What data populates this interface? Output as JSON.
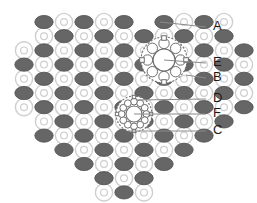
{
  "figure": {
    "background": "#ffffff",
    "width": 257,
    "height": 203
  },
  "colors": {
    "dark_particle": "#666666",
    "dark_particle_stroke": "#4d4d4d",
    "light_ring_stroke": "#cfcfcf",
    "light_ring_fill": "#ffffff",
    "leader_line": "#8a8a8a",
    "label_text": "#1a1a1a",
    "rosette_stroke": "#6e6e6e",
    "rosette_fill": "#ffffff"
  },
  "lattice": {
    "description": "Alternating dark ellipse particles and light open rings arranged on a rectangular grid forming a heart outline",
    "origin_x": 24,
    "origin_y": 22,
    "pitch_x": 20,
    "pitch_y": 14.2,
    "dark_rx": 9.2,
    "dark_ry": 6.6,
    "ring_r": 8.6,
    "ring_inner_r": 3.4,
    "rows": [
      {
        "y_index": 0,
        "cols": [
          1,
          2,
          3,
          4,
          5,
          7,
          8,
          9,
          10
        ],
        "start_type": "ring"
      },
      {
        "y_index": 1,
        "cols": [
          1,
          2,
          3,
          4,
          5,
          6,
          7,
          8,
          9,
          10
        ],
        "start_type": "dark"
      },
      {
        "y_index": 2,
        "cols": [
          0,
          1,
          2,
          3,
          4,
          5,
          6,
          7,
          8,
          9,
          10,
          11
        ],
        "start_type": "ring"
      },
      {
        "y_index": 3,
        "cols": [
          0,
          1,
          2,
          3,
          4,
          5,
          6,
          7,
          8,
          9,
          10,
          11
        ],
        "start_type": "dark"
      },
      {
        "y_index": 4,
        "cols": [
          0,
          1,
          2,
          3,
          4,
          5,
          6,
          7,
          8,
          9,
          10,
          11
        ],
        "start_type": "ring"
      },
      {
        "y_index": 5,
        "cols": [
          0,
          1,
          2,
          3,
          4,
          5,
          6,
          7,
          8,
          9,
          10,
          11
        ],
        "start_type": "dark"
      },
      {
        "y_index": 6,
        "cols": [
          0,
          1,
          2,
          3,
          4,
          5,
          6,
          7,
          8,
          9,
          10,
          11
        ],
        "start_type": "ring"
      },
      {
        "y_index": 7,
        "cols": [
          1,
          2,
          3,
          4,
          5,
          6,
          7,
          8,
          9,
          10
        ],
        "start_type": "dark"
      },
      {
        "y_index": 8,
        "cols": [
          1,
          2,
          3,
          4,
          5,
          6,
          7,
          8,
          9
        ],
        "start_type": "ring"
      },
      {
        "y_index": 9,
        "cols": [
          2,
          3,
          4,
          5,
          6,
          7,
          8
        ],
        "start_type": "dark"
      },
      {
        "y_index": 10,
        "cols": [
          3,
          4,
          5,
          6,
          7
        ],
        "start_type": "ring"
      },
      {
        "y_index": 11,
        "cols": [
          4,
          5,
          6
        ],
        "start_type": "dark"
      },
      {
        "y_index": 12,
        "cols": [
          4,
          5,
          6
        ],
        "start_type": "ring"
      }
    ]
  },
  "rosettes": [
    {
      "id": "upper-rosette",
      "name": "eight-fold-rosette",
      "cx": 164,
      "cy": 60,
      "outer_r": 23,
      "core_r": 11,
      "petals": 8,
      "petal_r": 5.2,
      "petal_orbit": 16.5,
      "nodes": 4,
      "node_size": 4.6,
      "node_orbit": 22
    },
    {
      "id": "lower-rosette",
      "name": "twelve-fold-rosette",
      "cx": 134,
      "cy": 114,
      "outer_r": 18,
      "core_r": 8,
      "petals": 12,
      "petal_r": 3.4,
      "petal_orbit": 12.4,
      "nodes": 4,
      "node_size": 3.4,
      "node_orbit": 17
    }
  ],
  "labels": [
    {
      "id": "A",
      "text": "A",
      "x": 213,
      "y": 27,
      "leader": {
        "x1": 160,
        "y1": 22,
        "x2": 206,
        "y2": 27
      }
    },
    {
      "id": "E",
      "text": "E",
      "x": 213,
      "y": 63,
      "leader": {
        "x1": 164,
        "y1": 60,
        "x2": 206,
        "y2": 63
      }
    },
    {
      "id": "B",
      "text": "B",
      "x": 213,
      "y": 78,
      "leader": {
        "x1": 186,
        "y1": 75,
        "x2": 206,
        "y2": 78
      }
    },
    {
      "id": "D",
      "text": "D",
      "x": 213,
      "y": 99,
      "leader": {
        "x1": 136,
        "y1": 100,
        "x2": 206,
        "y2": 99
      }
    },
    {
      "id": "F",
      "text": "F",
      "x": 213,
      "y": 114,
      "leader": {
        "x1": 134,
        "y1": 114,
        "x2": 206,
        "y2": 114
      }
    },
    {
      "id": "C",
      "text": "C",
      "x": 213,
      "y": 131,
      "leader": {
        "x1": 128,
        "y1": 131,
        "x2": 206,
        "y2": 131
      }
    }
  ]
}
